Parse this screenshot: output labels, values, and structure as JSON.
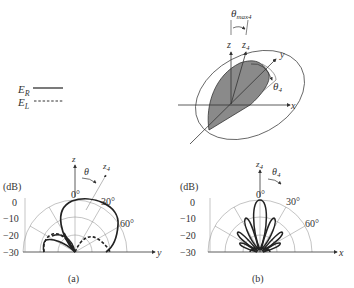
{
  "legend": {
    "items": [
      {
        "label": "E",
        "sub": "R",
        "style": "solid"
      },
      {
        "label": "E",
        "sub": "L",
        "style": "dashed"
      }
    ]
  },
  "diagram3d": {
    "theta_max": {
      "symbol": "θ",
      "sub": "max4"
    },
    "axis_z": "z",
    "axis_z4": {
      "label": "z",
      "sub": "4"
    },
    "axis_y": "y",
    "axis_x": "x",
    "theta4": {
      "symbol": "θ",
      "sub": "4"
    }
  },
  "plot_a": {
    "caption": "(a)",
    "unit": "(dB)",
    "db_ticks": [
      "0",
      "−10",
      "−20",
      "−30"
    ],
    "angle_labels": [
      "0°",
      "30°",
      "60°"
    ],
    "axis_z": "z",
    "axis_z4": {
      "label": "z",
      "sub": "4"
    },
    "theta": "θ",
    "axis_h": "y"
  },
  "plot_b": {
    "caption": "(b)",
    "unit": "(dB)",
    "db_ticks": [
      "0",
      "−10",
      "−20",
      "−30"
    ],
    "angle_labels": [
      "0°",
      "30°",
      "60°"
    ],
    "axis_z4": {
      "label": "z",
      "sub": "4"
    },
    "theta4": {
      "symbol": "θ",
      "sub": "4"
    },
    "axis_h": "x"
  }
}
